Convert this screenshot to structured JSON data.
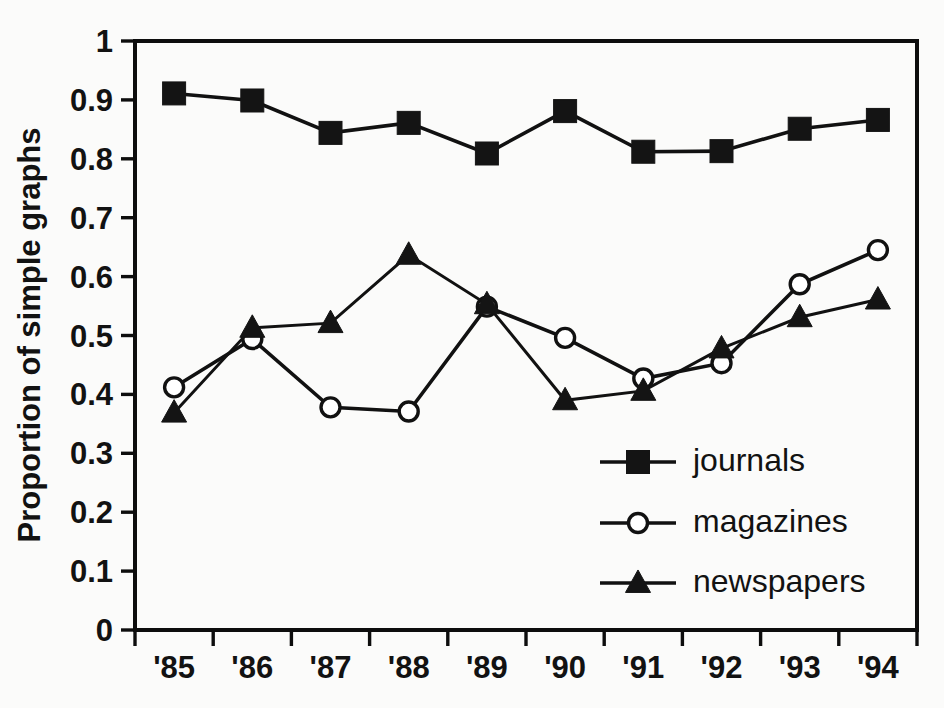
{
  "chart_data": {
    "type": "line",
    "title": "",
    "xlabel": "",
    "ylabel": "Proportion of simple graphs",
    "categories": [
      "'85",
      "'86",
      "'87",
      "'88",
      "'89",
      "'90",
      "'91",
      "'92",
      "'93",
      "'94"
    ],
    "ylim": [
      0,
      1
    ],
    "yticks": [
      "0",
      "0.1",
      "0.2",
      "0.3",
      "0.4",
      "0.5",
      "0.6",
      "0.7",
      "0.8",
      "0.9",
      "1"
    ],
    "ytick_values": [
      0,
      0.1,
      0.2,
      0.3,
      0.4,
      0.5,
      0.6,
      0.7,
      0.8,
      0.9,
      1
    ],
    "grid": false,
    "legend_position": "center-right-lower",
    "series": [
      {
        "name": "journals",
        "marker": "filled-square",
        "values": [
          0.911,
          0.899,
          0.844,
          0.861,
          0.809,
          0.881,
          0.812,
          0.813,
          0.851,
          0.866
        ]
      },
      {
        "name": "magazines",
        "marker": "open-circle",
        "values": [
          0.412,
          0.494,
          0.378,
          0.371,
          0.549,
          0.496,
          0.427,
          0.453,
          0.587,
          0.645
        ]
      },
      {
        "name": "newspapers",
        "marker": "filled-triangle",
        "values": [
          0.369,
          0.513,
          0.521,
          0.637,
          0.553,
          0.39,
          0.406,
          0.478,
          0.531,
          0.561
        ]
      }
    ]
  },
  "legend": {
    "entries": [
      {
        "label": "journals",
        "marker": "filled-square"
      },
      {
        "label": "magazines",
        "marker": "open-circle"
      },
      {
        "label": "newspapers",
        "marker": "filled-triangle"
      }
    ]
  },
  "colors": {
    "ink": "#111111",
    "background": "#fbfbfa",
    "marker_fill": "#141414",
    "open_marker_fill": "#ffffff"
  }
}
